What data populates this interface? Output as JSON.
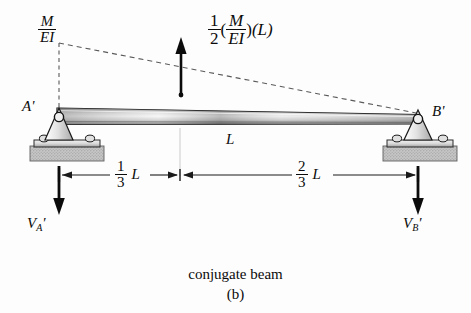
{
  "figure": {
    "caption_main": "conjugate beam",
    "caption_sub": "(b)",
    "background_color": "#fdfdfd",
    "ink_color": "#0b0b0b"
  },
  "diagram": {
    "type": "conjugate-beam-free-body-diagram",
    "distributed_load": {
      "label_numerator": "M",
      "label_denominator": "EI",
      "shape": "triangular",
      "peak_at": "left end A'",
      "zero_at": "right end B'"
    },
    "resultant_force": {
      "coefficient_num": "1",
      "coefficient_den": "2",
      "term_num": "M",
      "term_den": "EI",
      "open_paren": "(",
      "close_paren_1": ")",
      "length_term": "(L)",
      "direction": "up"
    },
    "supports": [
      {
        "name": "A'",
        "type": "pin",
        "letter": "A",
        "prime": "′",
        "x": 55
      },
      {
        "name": "B'",
        "type": "pin",
        "letter": "B",
        "prime": "′",
        "x": 418
      }
    ],
    "beam": {
      "span_label": "L",
      "left_x": 55,
      "right_x": 418
    },
    "dimensions": [
      {
        "num": "1",
        "den": "3",
        "unit": "L",
        "from": "A'",
        "to": "centroid"
      },
      {
        "num": "2",
        "den": "3",
        "unit": "L",
        "from": "centroid",
        "to": "B'"
      }
    ],
    "reactions": [
      {
        "symbol": "V",
        "subscript": "A",
        "prime": "′",
        "direction": "down",
        "x": 55
      },
      {
        "symbol": "V",
        "subscript": "B",
        "prime": "′",
        "direction": "down",
        "x": 418
      }
    ]
  }
}
